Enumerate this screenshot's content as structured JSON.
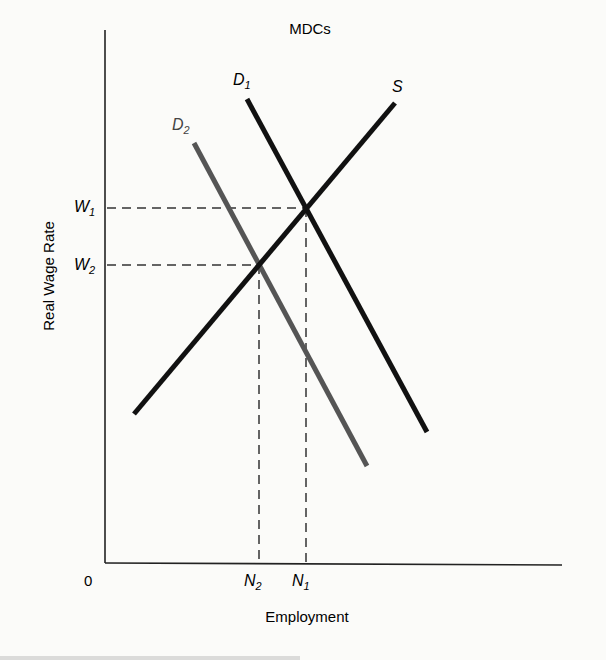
{
  "chart_data": {
    "type": "line",
    "title": "MDCs",
    "xlabel": "Employment",
    "ylabel": "Real Wage Rate",
    "origin_label": "0",
    "grid": false,
    "legend": "none (curves labeled inline)",
    "series": [
      {
        "name": "S",
        "label": "S",
        "kind": "supply",
        "color": "#111111",
        "from": {
          "x": 134,
          "y": 414
        },
        "to": {
          "x": 395,
          "y": 103
        }
      },
      {
        "name": "D1",
        "label": "D",
        "sub": "1",
        "kind": "demand",
        "color": "#111111",
        "from": {
          "x": 247,
          "y": 99
        },
        "to": {
          "x": 427,
          "y": 432
        }
      },
      {
        "name": "D2",
        "label": "D",
        "sub": "2",
        "kind": "demand",
        "color": "#555555",
        "from": {
          "x": 194,
          "y": 143
        },
        "to": {
          "x": 367,
          "y": 466
        }
      }
    ],
    "equilibria": [
      {
        "wage_label": "W",
        "wage_sub": "1",
        "emp_label": "N",
        "emp_sub": "1",
        "point": {
          "x": 306,
          "y": 208
        },
        "curves": [
          "S",
          "D1"
        ]
      },
      {
        "wage_label": "W",
        "wage_sub": "2",
        "emp_label": "N",
        "emp_sub": "2",
        "point": {
          "x": 259,
          "y": 265
        },
        "curves": [
          "S",
          "D2"
        ]
      }
    ],
    "annotations": [
      "W1 > W2",
      "N1 > N2",
      "Demand shift from D1 to D2 lowers wage and employment"
    ]
  },
  "caption_partial": "(truncated figure caption at bottom edge)"
}
